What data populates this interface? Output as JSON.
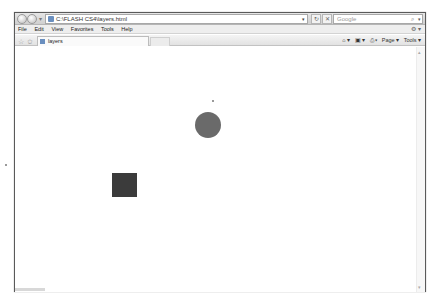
{
  "browser": {
    "address": "C:\\FLASH CS4\\layers.html",
    "search_placeholder": "Google",
    "menu": [
      "File",
      "Edit",
      "View",
      "Favorites",
      "Tools",
      "Help"
    ],
    "tab_title": "layers",
    "command_bar": {
      "home": "⌂ ▾",
      "feeds": "▣ ▾",
      "print": "⎙ ▾",
      "page": "Page ▾",
      "tools": "Tools ▾"
    },
    "icons": {
      "back": "back-arrow-icon",
      "forward": "forward-arrow-icon",
      "refresh": "↻",
      "stop": "✕",
      "search": "⌕",
      "favorites_star": "☆",
      "add_favorites": "✩"
    }
  },
  "page": {
    "shapes": [
      {
        "type": "circle",
        "cx": 208,
        "cy": 125,
        "r": 13,
        "color": "#6a6a6a"
      },
      {
        "type": "square",
        "x": 112,
        "y": 173,
        "w": 25,
        "h": 24,
        "color": "#3b3b3b"
      }
    ],
    "dots": [
      {
        "x": 212,
        "y": 100
      },
      {
        "x": 5,
        "y": 164
      }
    ]
  }
}
